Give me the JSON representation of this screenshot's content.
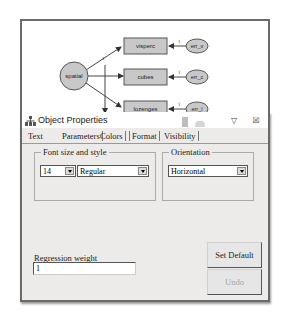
{
  "diagram": {
    "latent": {
      "label": "spatial"
    },
    "observed": [
      {
        "label": "visperc"
      },
      {
        "label": "cubes"
      },
      {
        "label": "lozenges"
      }
    ],
    "errors": [
      {
        "label": "err_v"
      },
      {
        "label": "err_c"
      },
      {
        "label": "err_l"
      }
    ],
    "path_weight_label": "1",
    "error_weight_labels": [
      "1",
      "1",
      "1"
    ],
    "colors": {
      "node_fill": "#c8c8c8",
      "node_stroke": "#555555"
    }
  },
  "dialog": {
    "title": "Object Properties",
    "title_buttons": {
      "pin": "▽",
      "close": "☒"
    },
    "tabs": [
      {
        "label": "Text",
        "active": false
      },
      {
        "label": "Parameters",
        "active": true
      },
      {
        "label": "Colors",
        "active": false
      },
      {
        "label": "Format",
        "active": false
      },
      {
        "label": "Visibility",
        "active": false
      }
    ],
    "font_group": {
      "label": "Font size and style",
      "size_value": "14",
      "style_value": "Regular"
    },
    "orientation_group": {
      "label": "Orientation",
      "value": "Horizontal"
    },
    "regression_weight": {
      "label": "Regression weight",
      "value": "1"
    },
    "buttons": {
      "set_default": "Set Default",
      "undo": "Undo"
    }
  }
}
